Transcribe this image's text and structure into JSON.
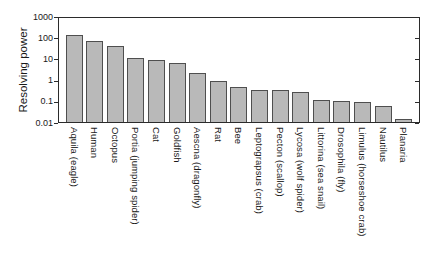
{
  "chart_data": {
    "type": "bar",
    "title": "",
    "ylabel": "Resolving power",
    "xlabel": "",
    "y_scale": "log",
    "ylim": [
      0.01,
      1000
    ],
    "y_ticks": [
      "1000",
      "100",
      "10",
      "1",
      "0.1",
      "0.01"
    ],
    "grid": false,
    "legend": "none",
    "categories": [
      "Aquila (eagle)",
      "Human",
      "Octopus",
      "Portia (jumping spider)",
      "Cat",
      "Goldfish",
      "Aescna (dragonfly)",
      "Rat",
      "Bee",
      "Leptograpsus (crab)",
      "Pecton (scallop)",
      "Lycosa (wolf spider)",
      "Littorina (sea snail)",
      "Drosophila (fly)",
      "Limulus (horseshoe crab)",
      "Nautilus",
      "Planaria"
    ],
    "values": [
      140,
      70,
      44,
      12,
      9.5,
      7,
      2.2,
      1.0,
      0.5,
      0.35,
      0.35,
      0.3,
      0.12,
      0.11,
      0.1,
      0.065,
      0.015
    ],
    "colors": {
      "bar_fill": "#b9b9b9",
      "bar_border": "#4f4f4f",
      "axis": "#2b2b2b",
      "text": "#1a1a1a",
      "background": "#ffffff"
    }
  }
}
